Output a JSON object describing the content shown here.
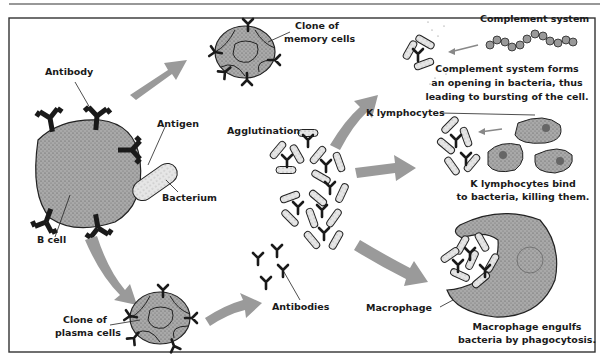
{
  "labels": {
    "antibody": "Antibody",
    "antigen": "Antigen",
    "bacterium": "Bacterium",
    "b_cell": "B cell",
    "clone_memory_1": "Clone of",
    "clone_memory_2": "memory cells",
    "clone_plasma_1": "Clone of",
    "clone_plasma_2": "plasma cells",
    "antibodies": "Antibodies",
    "agglutination": "Agglutination",
    "complement_system": "Complement system",
    "k_lymphocytes": "K lymphocytes",
    "macrophage": "Macrophage"
  },
  "captions": {
    "complement": [
      "Complement system forms",
      "an opening in bacteria, thus",
      "leading to bursting of the cell."
    ],
    "k_lymph": [
      "K lymphocytes bind",
      "to bacteria, killing them."
    ],
    "macrophage": [
      "Macrophage engulfs",
      "bacteria by phagocytosis."
    ]
  },
  "colors": {
    "cell_fill": "#a8a8a8",
    "arrow_fill": "#9a9a9a",
    "antibody": "#1a1a1a",
    "bacterium_fill": "#e8e8e8",
    "frame": "#333333"
  }
}
